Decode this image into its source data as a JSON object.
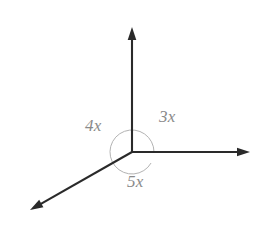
{
  "figure": {
    "kind": "geometry-diagram",
    "background_color": "#ffffff",
    "ray_color": "#2a2a2a",
    "arc_color": "#b3b3b3",
    "label_color": "#8a8a8a"
  },
  "vertex": {
    "x": 132,
    "y": 152
  },
  "rays": [
    {
      "name": "up-ray",
      "to_x": 132,
      "to_y": 27,
      "direction": "up",
      "has_arrow": true
    },
    {
      "name": "right-ray",
      "to_x": 250,
      "to_y": 152,
      "direction": "right",
      "has_arrow": true
    },
    {
      "name": "lower-left-ray",
      "to_x": 30,
      "to_y": 210,
      "direction": "lower-left",
      "has_arrow": true
    }
  ],
  "arc": {
    "radius": 22,
    "start_angle_deg": 0,
    "sweep_deg": 330
  },
  "labels": {
    "angle_up_right": "3x",
    "angle_up_left": "4x",
    "angle_bottom": "5x"
  },
  "chart_data": {
    "type": "diagram",
    "title": "",
    "angles": [
      {
        "label": "3x",
        "between": [
          "up-ray",
          "right-ray"
        ],
        "position": "upper-right"
      },
      {
        "label": "4x",
        "between": [
          "lower-left-ray",
          "up-ray"
        ],
        "position": "upper-left"
      },
      {
        "label": "5x",
        "between": [
          "right-ray",
          "lower-left-ray"
        ],
        "position": "bottom"
      }
    ]
  }
}
